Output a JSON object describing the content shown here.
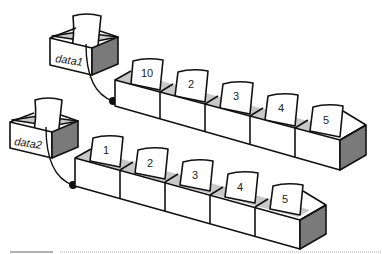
{
  "diagram": {
    "variables": [
      {
        "name": "data1",
        "list": [
          10,
          2,
          3,
          4,
          5
        ]
      },
      {
        "name": "data2",
        "list": [
          1,
          2,
          3,
          4,
          5
        ]
      }
    ],
    "colors": {
      "line": "#111111",
      "front_face": "#ffffff",
      "inner_face": "#c8c8c8",
      "side_face": "#7a7a7a",
      "card": "#ffffff",
      "rule_solid": "#999999",
      "rule_dotted": "#aaaaaa"
    }
  }
}
